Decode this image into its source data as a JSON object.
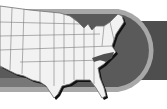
{
  "graphic": {
    "subject": "United States map",
    "highlighted_state": "North Carolina",
    "colors": {
      "background": "#ffffff",
      "banner_fill": "#5a5a5a",
      "banner_ring": "#a8a8a8",
      "banner_tail": "#4e4e4e",
      "map_fill": "#f2f2f2",
      "map_border": "#6e6e6e",
      "map_shadow": "#111111",
      "highlight_fill": "#505050"
    }
  }
}
